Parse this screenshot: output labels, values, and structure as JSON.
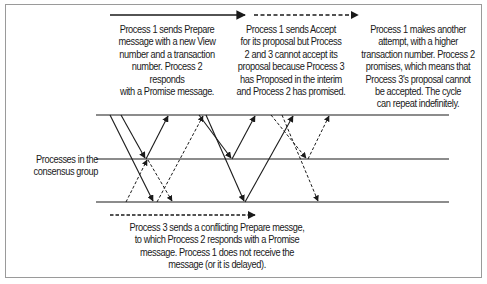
{
  "diagram": {
    "side_label": {
      "line1": "Processes in the",
      "line2": "consensus group"
    },
    "captions": {
      "phase1": {
        "lines": [
          "Process 1 sends Prepare",
          "message with a new View",
          "number and a transaction",
          "number. Process 2 responds",
          "with a Promise message."
        ]
      },
      "phase2": {
        "lines": [
          "Process 1 sends Accept",
          "for its proposal but Process",
          "2 and 3 cannot accept its",
          "proposal because Process 3",
          "has Proposed in the interim",
          "and Process 2 has promised."
        ]
      },
      "phase3": {
        "lines": [
          "Process 1 makes another",
          "attempt, with a higher",
          "transaction number. Process 2",
          "promises, which means that",
          "Process 3's proposal cannot",
          "be accepted. The cycle",
          "can repeat indefinitely."
        ]
      },
      "conflict": {
        "lines": [
          "Process 3 sends a conflicting Prepare messge,",
          "to which Process 2 responds with a Promise",
          "message. Process 1 does not receive the",
          "message (or it is delayed)."
        ]
      }
    },
    "process_lines": [
      {
        "name": "process-1",
        "y": 115
      },
      {
        "name": "process-2",
        "y": 159
      },
      {
        "name": "process-3",
        "y": 202
      }
    ],
    "colors": {
      "line": "#1a1a1a",
      "frame": "#9a9a9a",
      "background": "#ffffff"
    }
  }
}
